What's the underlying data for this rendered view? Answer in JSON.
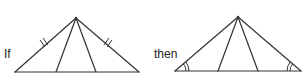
{
  "figure": {
    "left": {
      "label": "If",
      "marks": "double tick marks on both legs (congruent sides)"
    },
    "right": {
      "label": "then",
      "marks": "double arcs on both base angles (congruent angles)"
    }
  },
  "colors": {
    "stroke": "#333333",
    "background": "#ffffff"
  }
}
